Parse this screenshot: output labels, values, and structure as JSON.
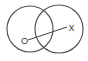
{
  "diagram": {
    "type": "venn-two-circles",
    "circles": [
      {
        "name": "left-circle"
      },
      {
        "name": "right-circle"
      }
    ],
    "labels": {
      "start": "O",
      "end": "X"
    },
    "colors": {
      "stroke": "#555555",
      "text": "#333333",
      "background": "#ffffff"
    }
  }
}
